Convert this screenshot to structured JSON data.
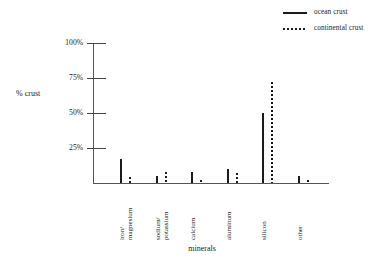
{
  "chart_data": {
    "type": "bar",
    "title": "",
    "xlabel": "minerals",
    "ylabel": "% crust",
    "ylim": [
      0,
      100
    ],
    "grid": false,
    "legend_position": "top-right",
    "categories": [
      "iron/\nmagnesium",
      "sodium/\npotassium",
      "calcium",
      "aluminum",
      "silicon",
      "other"
    ],
    "category_lines": [
      [
        "iron/",
        "magnesium"
      ],
      [
        "sodium/",
        "potassium"
      ],
      [
        "calcium"
      ],
      [
        "aluminum"
      ],
      [
        "silicon"
      ],
      [
        "other"
      ]
    ],
    "series": [
      {
        "name": "ocean crust",
        "style": "solid",
        "color": "#1a1a1a",
        "values": [
          17,
          5,
          8,
          10,
          50,
          5
        ]
      },
      {
        "name": "continental crust",
        "style": "dotted",
        "color": "#1a1a1a",
        "values": [
          4,
          8,
          2,
          7,
          72,
          2
        ]
      }
    ],
    "ytick_labels": [
      "100%",
      "75%",
      "50%",
      "25%"
    ],
    "ytick_values": [
      100,
      75,
      50,
      25
    ]
  },
  "legend": {
    "items": [
      {
        "label": "ocean crust",
        "style": "solid"
      },
      {
        "label": "continental crust",
        "style": "dotted"
      }
    ]
  },
  "axes": {
    "y_title": "% crust",
    "x_title": "minerals"
  }
}
